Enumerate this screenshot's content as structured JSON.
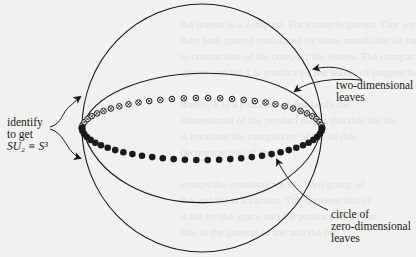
{
  "figure": {
    "colors": {
      "background": "#f1f1ef",
      "ink": "#1a1a1a",
      "ghost_text": "#e2e2df"
    },
    "labels": {
      "identify": {
        "line1": "identify",
        "line2": "to get",
        "line3": "SU₂ ≡ S³"
      },
      "two_dimensional": {
        "line1": "two-dimensional",
        "line2": "leaves"
      },
      "zero_dimensional": {
        "line1": "circle of",
        "line2": "zero-dimensional",
        "line3": "leaves"
      }
    },
    "geometry": {
      "outer_sphere": {
        "cx": 202,
        "cy": 128,
        "rx": 120,
        "ry": 124
      },
      "left_pole": {
        "x": 82,
        "y": 128
      },
      "right_pole": {
        "x": 322,
        "y": 128
      },
      "equator_upper_peak_y": 98,
      "equator_lower_trough_y": 160,
      "inner_arc_upper_peak_y": 73,
      "inner_arc_lower_trough_y": 198,
      "open_circle_count": 30,
      "filled_dot_count": 32
    }
  }
}
